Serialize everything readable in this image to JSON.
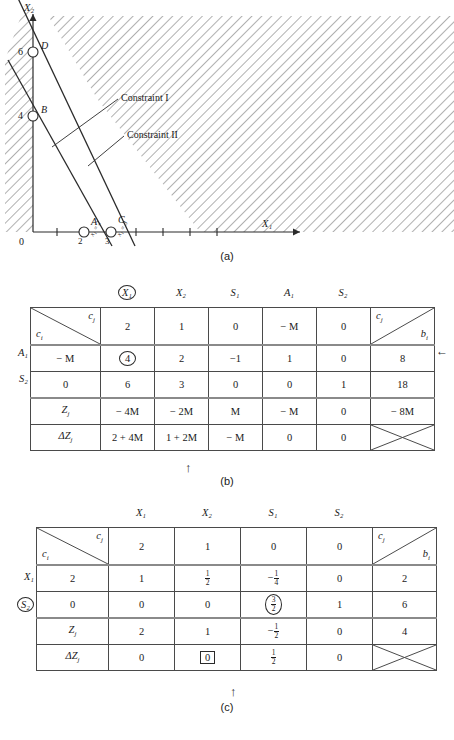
{
  "figure": {
    "panel_a_caption": "(a)",
    "panel_b_caption": "(b)",
    "panel_c_caption": "(c)"
  },
  "graph": {
    "x_axis_label": "X₁",
    "y_axis_label": "X₂",
    "origin_label": "0",
    "y_ticks": [
      "6",
      "4"
    ],
    "x_ticks": [
      "2",
      "3"
    ],
    "points": [
      {
        "label": "D",
        "x": 0,
        "y": 6
      },
      {
        "label": "B",
        "x": 0,
        "y": 4
      },
      {
        "label": "A",
        "x": 2,
        "y": 0
      },
      {
        "label": "C",
        "x": 3,
        "y": 0
      }
    ],
    "annotations": [
      {
        "label": "Constraint I"
      },
      {
        "label": "Constraint II"
      }
    ],
    "rotated_tick_a": "x₁ = 2",
    "rotated_tick_c": "x₁ = 3",
    "shading": "hatched"
  },
  "table_b": {
    "col_headers": [
      "X₁",
      "X₂",
      "S₁",
      "A₁",
      "S₂"
    ],
    "circled_col_index": 0,
    "corner_cell": {
      "upper_right": "c",
      "upper_right_sub": "j",
      "lower_left": "c",
      "lower_left_sub": "i"
    },
    "b_cell": {
      "upper_left": "c",
      "upper_left_sub": "j",
      "lower_right": "b",
      "lower_right_sub": "i"
    },
    "theta_header": "θ",
    "theta_header_sub": "i",
    "cj_row": [
      "2",
      "1",
      "0",
      "− M",
      "0"
    ],
    "rows": [
      {
        "basis": "A₁",
        "ci": "− M",
        "cells": [
          "4",
          "2",
          "−1",
          "1",
          "0"
        ],
        "circled_cell_index": 0,
        "bi": "8",
        "theta": "2",
        "theta_circled": true,
        "arrow": true
      },
      {
        "basis": "S₂",
        "ci": "0",
        "cells": [
          "6",
          "3",
          "0",
          "0",
          "1"
        ],
        "circled_cell_index": -1,
        "bi": "18",
        "theta": "3",
        "theta_circled": false,
        "arrow": false
      }
    ],
    "zj_label": "Z",
    "zj_label_sub": "j",
    "zj_row": [
      "− 4M",
      "− 2M",
      "M",
      "− M",
      "0"
    ],
    "zj_bi": "− 8M",
    "dzj_label": "ΔZ",
    "dzj_label_sub": "j",
    "dzj_row": [
      "2 + 4M",
      "1 + 2M",
      "− M",
      "0",
      "0"
    ],
    "pivot_col_arrow_index": 2
  },
  "table_c": {
    "col_headers": [
      "X₁",
      "X₂",
      "S₁",
      "S₂"
    ],
    "corner_cell": {
      "upper_right": "c",
      "upper_right_sub": "j",
      "lower_left": "c",
      "lower_left_sub": "i"
    },
    "b_cell": {
      "upper_left": "c",
      "upper_left_sub": "j",
      "lower_right": "b",
      "lower_right_sub": "i"
    },
    "theta_header": "θ",
    "theta_header_sub": "x₂",
    "cj_row": [
      "2",
      "1",
      "0",
      "0"
    ],
    "rows": [
      {
        "basis": "X₁",
        "basis_circled": false,
        "ci": "2",
        "cells": [
          "1",
          "1/2",
          "−1/4",
          "0"
        ],
        "circled_cell_index": -1,
        "bi": "2",
        "theta": "4",
        "theta_circled": true
      },
      {
        "basis": "S₂",
        "basis_circled": true,
        "ci": "0",
        "cells": [
          "0",
          "0",
          "3/2",
          "1"
        ],
        "circled_cell_index": 2,
        "bi": "6",
        "theta": "∞",
        "theta_circled": false
      }
    ],
    "zj_label": "Z",
    "zj_label_sub": "j",
    "zj_row": [
      "2",
      "1",
      "−1/2",
      "0"
    ],
    "zj_bi": "4",
    "dzj_label": "ΔZ",
    "dzj_label_sub": "j",
    "dzj_row": [
      "0",
      "0",
      "1/2",
      "0"
    ],
    "boxed_cell_index": 1,
    "pivot_col_arrow_index": 2
  }
}
